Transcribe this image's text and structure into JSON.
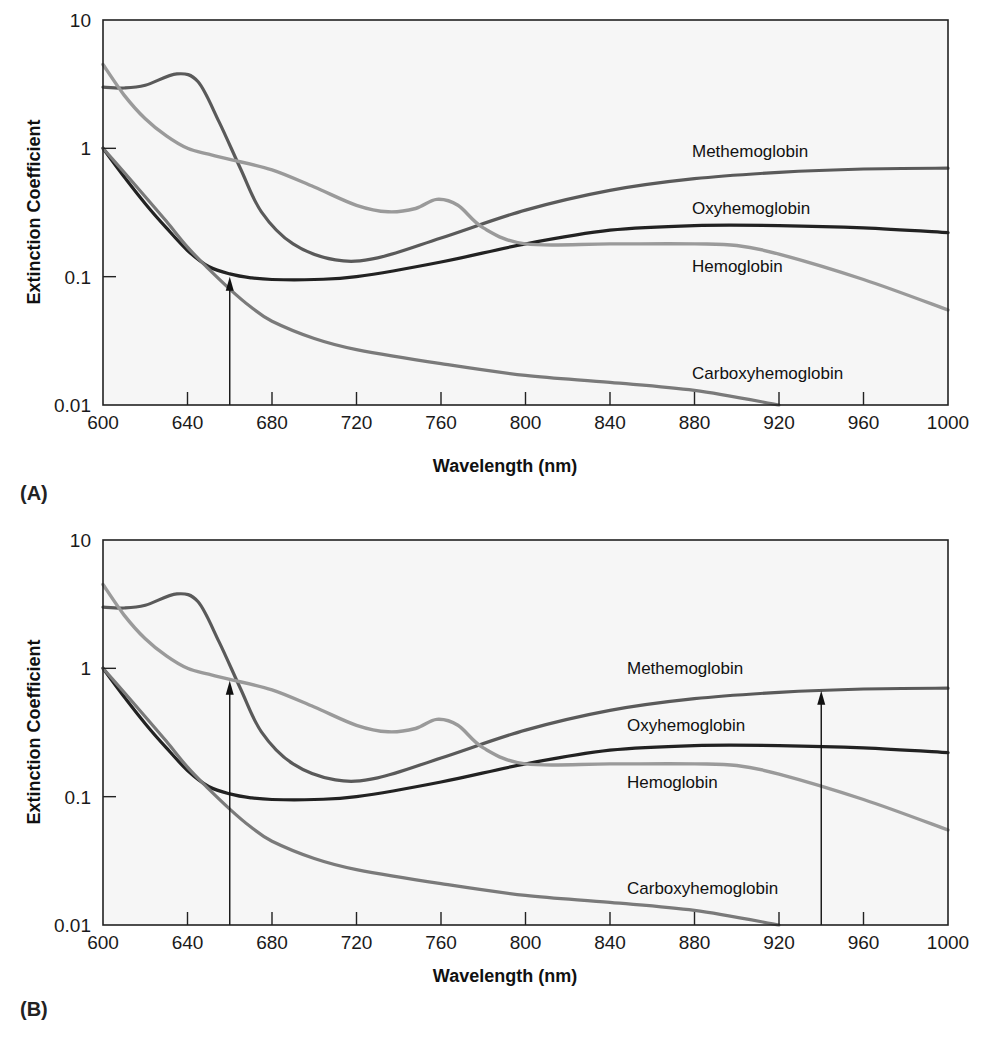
{
  "chart_data": [
    {
      "panel": "(A)",
      "type": "line",
      "title": "",
      "xlabel": "Wavelength (nm)",
      "ylabel": "Extinction Coefficient",
      "xlim": [
        600,
        1000
      ],
      "ylim": [
        0.01,
        10
      ],
      "yscale": "log",
      "xticks": [
        600,
        640,
        680,
        720,
        760,
        800,
        840,
        880,
        920,
        960,
        1000
      ],
      "yticks": [
        0.01,
        0.1,
        1,
        10
      ],
      "ytick_labels": [
        "0.01",
        "0.1",
        "1",
        "10"
      ],
      "grid": false,
      "series": [
        {
          "name": "Methemoglobin",
          "color": "#5a5a5a",
          "x": [
            600,
            610,
            620,
            635,
            645,
            655,
            665,
            675,
            690,
            710,
            730,
            760,
            800,
            840,
            880,
            920,
            960,
            1000
          ],
          "values": [
            3.0,
            2.95,
            3.1,
            3.8,
            3.3,
            1.6,
            0.7,
            0.32,
            0.18,
            0.135,
            0.14,
            0.2,
            0.33,
            0.47,
            0.58,
            0.65,
            0.69,
            0.7
          ]
        },
        {
          "name": "Oxyhemoglobin",
          "color": "#222222",
          "x": [
            600,
            610,
            620,
            630,
            640,
            650,
            660,
            670,
            680,
            700,
            720,
            760,
            800,
            840,
            880,
            920,
            960,
            1000
          ],
          "values": [
            1.0,
            0.6,
            0.37,
            0.24,
            0.16,
            0.12,
            0.105,
            0.098,
            0.095,
            0.095,
            0.1,
            0.13,
            0.18,
            0.23,
            0.25,
            0.25,
            0.24,
            0.22
          ]
        },
        {
          "name": "Hemoglobin",
          "color": "#9a9a9a",
          "x": [
            600,
            610,
            620,
            630,
            640,
            650,
            660,
            680,
            700,
            720,
            735,
            748,
            758,
            768,
            780,
            800,
            840,
            880,
            900,
            920,
            960,
            1000
          ],
          "values": [
            4.5,
            2.6,
            1.7,
            1.25,
            1.0,
            0.9,
            0.82,
            0.68,
            0.5,
            0.36,
            0.32,
            0.34,
            0.4,
            0.36,
            0.24,
            0.18,
            0.18,
            0.18,
            0.175,
            0.15,
            0.095,
            0.055
          ]
        },
        {
          "name": "Carboxyhemoglobin",
          "color": "#7a7a7a",
          "x": [
            600,
            610,
            620,
            630,
            640,
            650,
            660,
            670,
            680,
            700,
            720,
            760,
            800,
            840,
            880,
            920
          ],
          "values": [
            1.0,
            0.65,
            0.42,
            0.27,
            0.17,
            0.115,
            0.08,
            0.058,
            0.045,
            0.033,
            0.027,
            0.021,
            0.017,
            0.015,
            0.013,
            0.01
          ]
        }
      ],
      "annotations": [
        {
          "type": "arrow",
          "x": 660,
          "from": 0.01,
          "to": 0.1
        }
      ]
    },
    {
      "panel": "(B)",
      "type": "line",
      "title": "",
      "xlabel": "Wavelength (nm)",
      "ylabel": "Extinction Coefficient",
      "xlim": [
        600,
        1000
      ],
      "ylim": [
        0.01,
        10
      ],
      "yscale": "log",
      "xticks": [
        600,
        640,
        680,
        720,
        760,
        800,
        840,
        880,
        920,
        960,
        1000
      ],
      "yticks": [
        0.01,
        0.1,
        1,
        10
      ],
      "ytick_labels": [
        "0.01",
        "0.1",
        "1",
        "10"
      ],
      "grid": false,
      "series": "same as (A)",
      "annotations": [
        {
          "type": "arrow",
          "x": 660,
          "from": 0.01,
          "to": 0.8
        },
        {
          "type": "arrow",
          "x": 940,
          "from": 0.01,
          "to": 0.67
        }
      ]
    }
  ],
  "panels": [
    {
      "letter": "(A)",
      "ylabel": "Extinction Coefficient",
      "xlabel": "Wavelength (nm)",
      "labels": {
        "methemoglobin": "Methemoglobin",
        "oxyhemoglobin": "Oxyhemoglobin",
        "hemoglobin": "Hemoglobin",
        "carboxyhemoglobin": "Carboxyhemoglobin"
      }
    },
    {
      "letter": "(B)",
      "ylabel": "Extinction Coefficient",
      "xlabel": "Wavelength (nm)",
      "labels": {
        "methemoglobin": "Methemoglobin",
        "oxyhemoglobin": "Oxyhemoglobin",
        "hemoglobin": "Hemoglobin",
        "carboxyhemoglobin": "Carboxyhemoglobin"
      }
    }
  ],
  "colors": {
    "plot_bg": "#f6f6f6",
    "axis": "#222222",
    "methemoglobin": "#5a5a5a",
    "oxyhemoglobin": "#222222",
    "hemoglobin": "#9a9a9a",
    "carboxyhemoglobin": "#7a7a7a"
  }
}
